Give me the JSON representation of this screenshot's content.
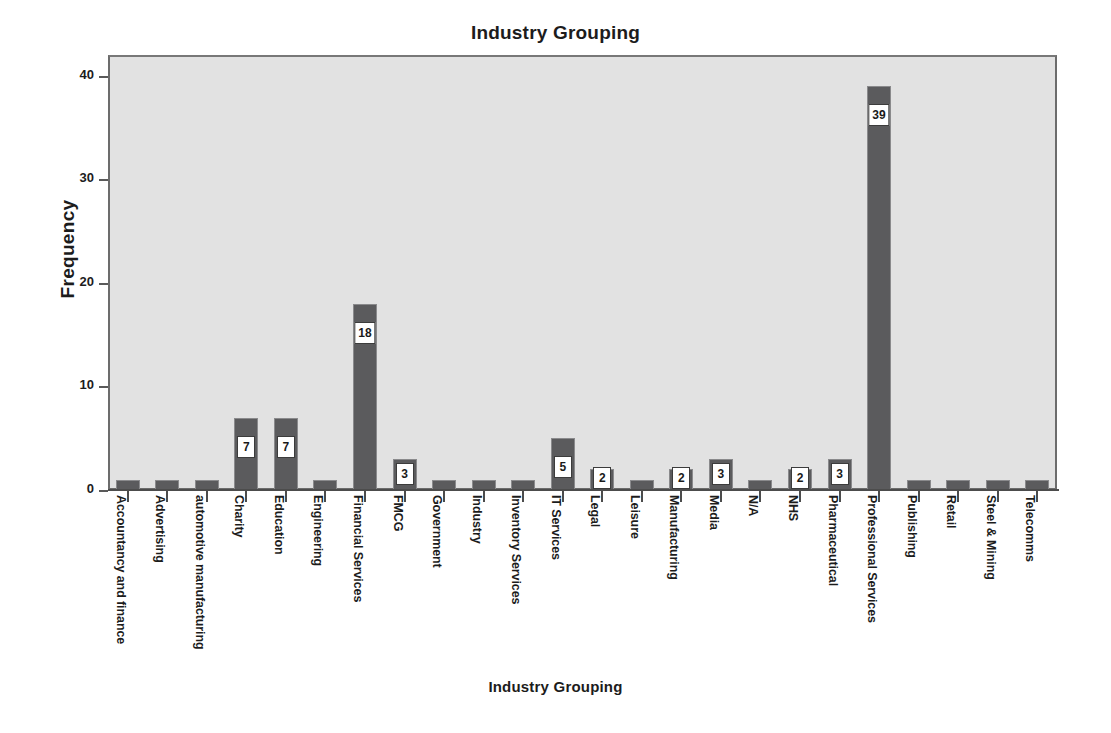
{
  "chart_data": {
    "type": "bar",
    "title": "Industry Grouping",
    "xlabel": "Industry Grouping",
    "ylabel": "Frequency",
    "ylim": [
      0,
      42
    ],
    "yticks": [
      0,
      10,
      20,
      30,
      40
    ],
    "ytick_labels": [
      "0",
      "10",
      "20",
      "30",
      "40"
    ],
    "grid": false,
    "legend": null,
    "bar_color": "#5b5b5d",
    "plot_background": "#e2e2e2",
    "data_labels_shown_threshold": "values of 2 or more are labelled in white boxes",
    "categories": [
      "Accountancy and finance",
      "Advertising",
      "automotive manufacturing",
      "Charity",
      "Education",
      "Engineering",
      "Financial Services",
      "FMCG",
      "Government",
      "Industry",
      "Inventory Services",
      "IT Services",
      "Legal",
      "Leisure",
      "Manufacturing",
      "Media",
      "N/A",
      "NHS",
      "Pharmaceutical",
      "Professional Services",
      "Publishing",
      "Retail",
      "Steel & Mining",
      "Telecomms"
    ],
    "values": [
      1,
      1,
      1,
      7,
      7,
      1,
      18,
      3,
      1,
      1,
      1,
      5,
      2,
      1,
      2,
      3,
      1,
      2,
      3,
      39,
      1,
      1,
      1,
      1
    ],
    "point_labels": [
      "",
      "",
      "",
      "7",
      "7",
      "",
      "18",
      "3",
      "",
      "",
      "",
      "5",
      "2",
      "",
      "2",
      "3",
      "",
      "2",
      "3",
      "39",
      "",
      "",
      "",
      ""
    ]
  }
}
